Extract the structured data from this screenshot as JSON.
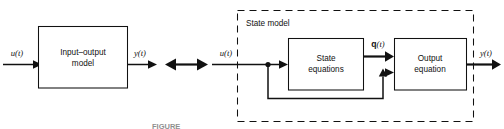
{
  "figure": {
    "background_color": "#ffffff",
    "line_color": "#111111",
    "caption": "FIGURE"
  },
  "input_output_model": {
    "block_label_line1": "Input–output",
    "block_label_line2": "model",
    "input_signal": "u(t)",
    "output_signal": "y(t)"
  },
  "equivalence": {
    "symbol_name": "double-headed-arrow"
  },
  "state_model": {
    "container_label": "State model",
    "input_signal": "u(t)",
    "output_signal": "y(t)",
    "state_signal_vector": "q",
    "state_signal_argument": "(t)",
    "state_block_line1": "State",
    "state_block_line2": "equations",
    "output_block_line1": "Output",
    "output_block_line2": "equation"
  }
}
